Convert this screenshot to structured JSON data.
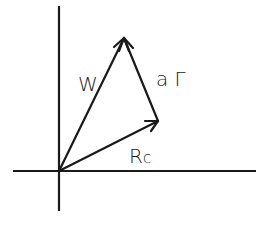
{
  "diagram": {
    "type": "vector-diagram",
    "origin": {
      "x": 59,
      "y": 171
    },
    "axes": {
      "vertical": {
        "x": 59,
        "y1": 6,
        "y2": 211
      },
      "horizontal": {
        "y": 171,
        "x1": 13,
        "x2": 256
      }
    },
    "vectors": [
      {
        "id": "w",
        "label": "W",
        "from": [
          59,
          171
        ],
        "to": [
          124,
          38
        ]
      },
      {
        "id": "a-gamma",
        "label": "a Γ",
        "from": [
          158,
          121
        ],
        "to": [
          124,
          38
        ]
      },
      {
        "id": "r-c",
        "label": "R",
        "subscript": "c",
        "from": [
          59,
          171
        ],
        "to": [
          158,
          121
        ]
      }
    ],
    "labels": {
      "w": "W",
      "a_gamma": "a Γ",
      "r_main": "R",
      "r_sub": "c"
    },
    "colors": {
      "stroke": "#1a1a1a",
      "background": "#ffffff"
    }
  }
}
